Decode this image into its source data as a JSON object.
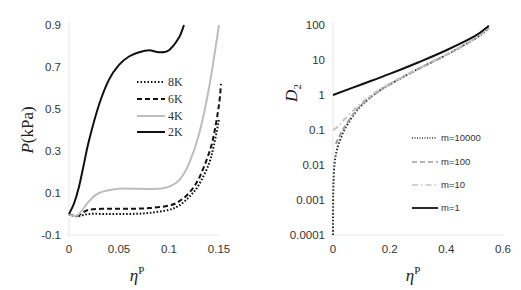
{
  "chart_data": [
    {
      "type": "line",
      "panel": "left",
      "title": "",
      "xlabel": "ηᴾ",
      "ylabel": "P(kPa)",
      "xlim": [
        0,
        0.15
      ],
      "ylim": [
        -0.1,
        0.9
      ],
      "xticks": [
        0,
        0.05,
        0.1,
        0.15
      ],
      "xtick_labels": [
        "0",
        "0.05",
        "0.1",
        "0.15"
      ],
      "yticks": [
        -0.1,
        0.1,
        0.3,
        0.5,
        0.7,
        0.9
      ],
      "ytick_labels": [
        "-0.1",
        "0.1",
        "0.3",
        "0.5",
        "0.7",
        "0.9"
      ],
      "grid": false,
      "legend_position": "inside-center",
      "series": [
        {
          "name": "8K",
          "style": "dotted",
          "color": "#111111",
          "x": [
            0,
            0.005,
            0.01,
            0.02,
            0.04,
            0.06,
            0.08,
            0.1,
            0.11,
            0.12,
            0.13,
            0.14,
            0.145,
            0.15
          ],
          "y": [
            0.0,
            -0.01,
            -0.01,
            0.0,
            0.0,
            0.0,
            0.005,
            0.02,
            0.04,
            0.08,
            0.14,
            0.24,
            0.33,
            0.45
          ]
        },
        {
          "name": "6K",
          "style": "dashed",
          "color": "#111111",
          "x": [
            0,
            0.005,
            0.01,
            0.02,
            0.04,
            0.06,
            0.08,
            0.1,
            0.11,
            0.12,
            0.13,
            0.14,
            0.145,
            0.15,
            0.152
          ],
          "y": [
            0.0,
            -0.01,
            -0.005,
            0.02,
            0.025,
            0.025,
            0.028,
            0.04,
            0.06,
            0.1,
            0.17,
            0.29,
            0.38,
            0.52,
            0.62
          ]
        },
        {
          "name": "4K",
          "style": "solid",
          "color": "#bdbdbd",
          "x": [
            0,
            0.005,
            0.01,
            0.02,
            0.03,
            0.05,
            0.07,
            0.09,
            0.1,
            0.11,
            0.12,
            0.13,
            0.14,
            0.15
          ],
          "y": [
            0.0,
            -0.01,
            0.0,
            0.06,
            0.1,
            0.12,
            0.12,
            0.12,
            0.13,
            0.16,
            0.24,
            0.38,
            0.6,
            0.9
          ]
        },
        {
          "name": "2K",
          "style": "solid",
          "color": "#111111",
          "x": [
            0,
            0.005,
            0.01,
            0.015,
            0.02,
            0.03,
            0.04,
            0.05,
            0.06,
            0.07,
            0.08,
            0.09,
            0.1,
            0.11,
            0.115
          ],
          "y": [
            0.0,
            0.05,
            0.13,
            0.24,
            0.35,
            0.52,
            0.64,
            0.71,
            0.75,
            0.77,
            0.78,
            0.77,
            0.78,
            0.84,
            0.9
          ]
        }
      ]
    },
    {
      "type": "line",
      "panel": "right",
      "title": "",
      "xlabel": "ηᴾ",
      "ylabel": "D₂",
      "xscale": "linear",
      "yscale": "log",
      "xlim": [
        0,
        0.6
      ],
      "ylim": [
        0.0001,
        100
      ],
      "xticks": [
        0,
        0.2,
        0.4,
        0.6
      ],
      "xtick_labels": [
        "0",
        "0.2",
        "0.4",
        "0.6"
      ],
      "yticks": [
        0.0001,
        0.001,
        0.01,
        0.1,
        1,
        10,
        100
      ],
      "ytick_labels": [
        "0.0001",
        "0.001",
        "0.01",
        "0.1",
        "1",
        "10",
        "100"
      ],
      "grid": false,
      "legend_position": "lower-right",
      "series": [
        {
          "name": "m=10000",
          "style": "dotted",
          "color": "#333333",
          "x": [
            0,
            0.0001,
            0.0005,
            0.001,
            0.002,
            0.005,
            0.01,
            0.02,
            0.04,
            0.07,
            0.1,
            0.15,
            0.2,
            0.3,
            0.4,
            0.5,
            0.55
          ],
          "y": [
            0.0001,
            0.0003,
            0.001,
            0.002,
            0.004,
            0.01,
            0.02,
            0.04,
            0.1,
            0.25,
            0.5,
            1.1,
            2.0,
            5.5,
            14,
            40,
            80
          ]
        },
        {
          "name": "m=100",
          "style": "dashed",
          "color": "#9e9e9e",
          "x": [
            0.01,
            0.02,
            0.04,
            0.07,
            0.1,
            0.15,
            0.2,
            0.3,
            0.4,
            0.5,
            0.55
          ],
          "y": [
            0.04,
            0.06,
            0.12,
            0.27,
            0.52,
            1.1,
            2.0,
            5.5,
            14,
            40,
            82
          ]
        },
        {
          "name": "m=10",
          "style": "dash-dot",
          "color": "#c4c4c4",
          "x": [
            0,
            0.02,
            0.04,
            0.07,
            0.1,
            0.15,
            0.2,
            0.3,
            0.4,
            0.5,
            0.55
          ],
          "y": [
            0.1,
            0.13,
            0.2,
            0.35,
            0.6,
            1.2,
            2.1,
            5.7,
            14.5,
            41,
            85
          ]
        },
        {
          "name": "m=1",
          "style": "solid",
          "color": "#111111",
          "x": [
            0,
            0.1,
            0.2,
            0.3,
            0.4,
            0.5,
            0.55
          ],
          "y": [
            1.0,
            2.0,
            4.0,
            8.5,
            19,
            48,
            95
          ]
        }
      ]
    }
  ],
  "left_chart": {
    "ylabel_italic": "P",
    "ylabel_rest": "(kPa)",
    "xlabel_symbol": "η",
    "xlabel_sup": "P",
    "legend": [
      "8K",
      "6K",
      "4K",
      "2K"
    ]
  },
  "right_chart": {
    "ylabel_symbol": "D",
    "ylabel_sub": "2",
    "xlabel_symbol": "η",
    "xlabel_sup": "P",
    "legend": [
      "m=10000",
      "m=100",
      "m=10",
      "m=1"
    ]
  }
}
